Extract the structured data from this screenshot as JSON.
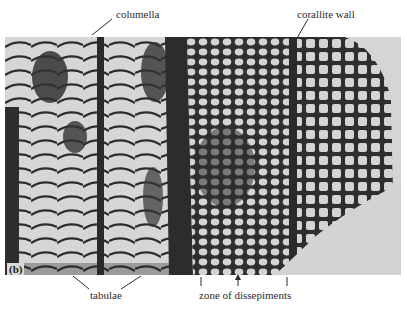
{
  "figure": {
    "panel_label": "(b)",
    "labels": {
      "columella": "columella",
      "corallite_wall": "corallite wall",
      "tabulae": "tabulae",
      "zone_of_dissepiments": "zone of dissepiments"
    },
    "colors": {
      "background": "#ffffff",
      "photo_light": "#d8d8d6",
      "photo_dark": "#2c2c2c",
      "text": "#2b2b2b"
    }
  }
}
